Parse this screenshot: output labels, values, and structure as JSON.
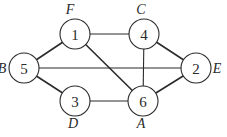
{
  "diagram": {
    "type": "undirected-graph",
    "node_radius": 15,
    "nodes": [
      {
        "id": "1",
        "label": "1",
        "letter": "F",
        "x": 75,
        "y": 34,
        "lx": 70,
        "ly": 9
      },
      {
        "id": "2",
        "label": "2",
        "letter": "E",
        "x": 196,
        "y": 68,
        "lx": 217,
        "ly": 68
      },
      {
        "id": "3",
        "label": "3",
        "letter": "D",
        "x": 75,
        "y": 101,
        "lx": 73,
        "ly": 123
      },
      {
        "id": "4",
        "label": "4",
        "letter": "C",
        "x": 144,
        "y": 34,
        "lx": 141,
        "ly": 9
      },
      {
        "id": "5",
        "label": "5",
        "letter": "B",
        "x": 24,
        "y": 68,
        "lx": 2,
        "ly": 68
      },
      {
        "id": "6",
        "label": "6",
        "letter": "A",
        "x": 143,
        "y": 101,
        "lx": 141,
        "ly": 123
      }
    ],
    "edges": [
      {
        "from": "1",
        "to": "4",
        "thick": false
      },
      {
        "from": "1",
        "to": "5",
        "thick": true
      },
      {
        "from": "1",
        "to": "6",
        "thick": true
      },
      {
        "from": "4",
        "to": "2",
        "thick": true
      },
      {
        "from": "4",
        "to": "6",
        "thick": false
      },
      {
        "from": "5",
        "to": "2",
        "thick": false
      },
      {
        "from": "5",
        "to": "3",
        "thick": true
      },
      {
        "from": "3",
        "to": "6",
        "thick": false
      },
      {
        "from": "6",
        "to": "2",
        "thick": true
      }
    ]
  }
}
